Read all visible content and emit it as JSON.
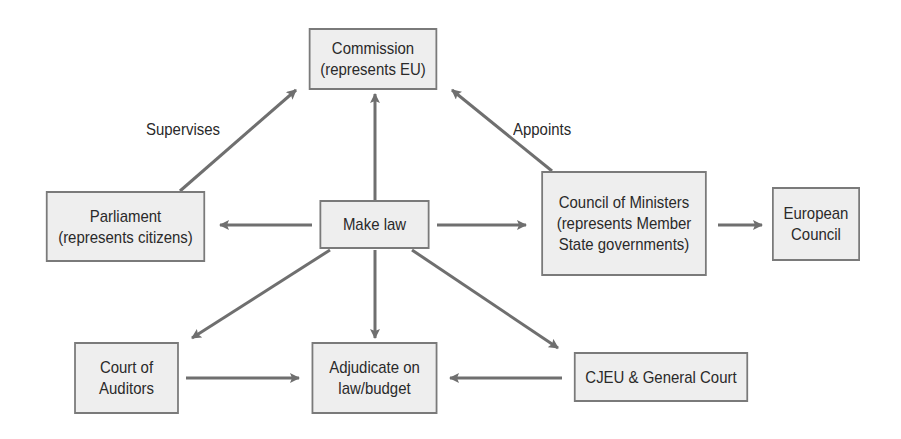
{
  "diagram": {
    "nodes": {
      "commission": {
        "line1": "Commission",
        "line2": "(represents EU)"
      },
      "parliament": {
        "line1": "Parliament",
        "line2": "(represents citizens)"
      },
      "make_law": {
        "line1": "Make law"
      },
      "council_ministers": {
        "line1": "Council of Ministers",
        "line2": "(represents Member",
        "line3": "State governments)"
      },
      "european_council": {
        "line1": "European",
        "line2": "Council"
      },
      "court_auditors": {
        "line1": "Court of",
        "line2": "Auditors"
      },
      "adjudicate": {
        "line1": "Adjudicate on",
        "line2": "law/budget"
      },
      "cjeu": {
        "line1": "CJEU & General Court"
      }
    },
    "edge_labels": {
      "supervises": "Supervises",
      "appoints": "Appoints"
    },
    "edges": [
      {
        "from": "parliament",
        "to": "commission",
        "label": "Supervises"
      },
      {
        "from": "council_ministers",
        "to": "commission",
        "label": "Appoints"
      },
      {
        "from": "make_law",
        "to": "commission"
      },
      {
        "from": "make_law",
        "to": "parliament"
      },
      {
        "from": "make_law",
        "to": "council_ministers"
      },
      {
        "from": "council_ministers",
        "to": "european_council"
      },
      {
        "from": "make_law",
        "to": "court_auditors"
      },
      {
        "from": "make_law",
        "to": "adjudicate"
      },
      {
        "from": "make_law",
        "to": "cjeu"
      },
      {
        "from": "court_auditors",
        "to": "adjudicate"
      },
      {
        "from": "cjeu",
        "to": "adjudicate"
      }
    ],
    "colors": {
      "box_fill": "#eeeeee",
      "box_border": "#7a7a7a",
      "arrow": "#6f6f6f",
      "text": "#2a2a2a"
    }
  }
}
